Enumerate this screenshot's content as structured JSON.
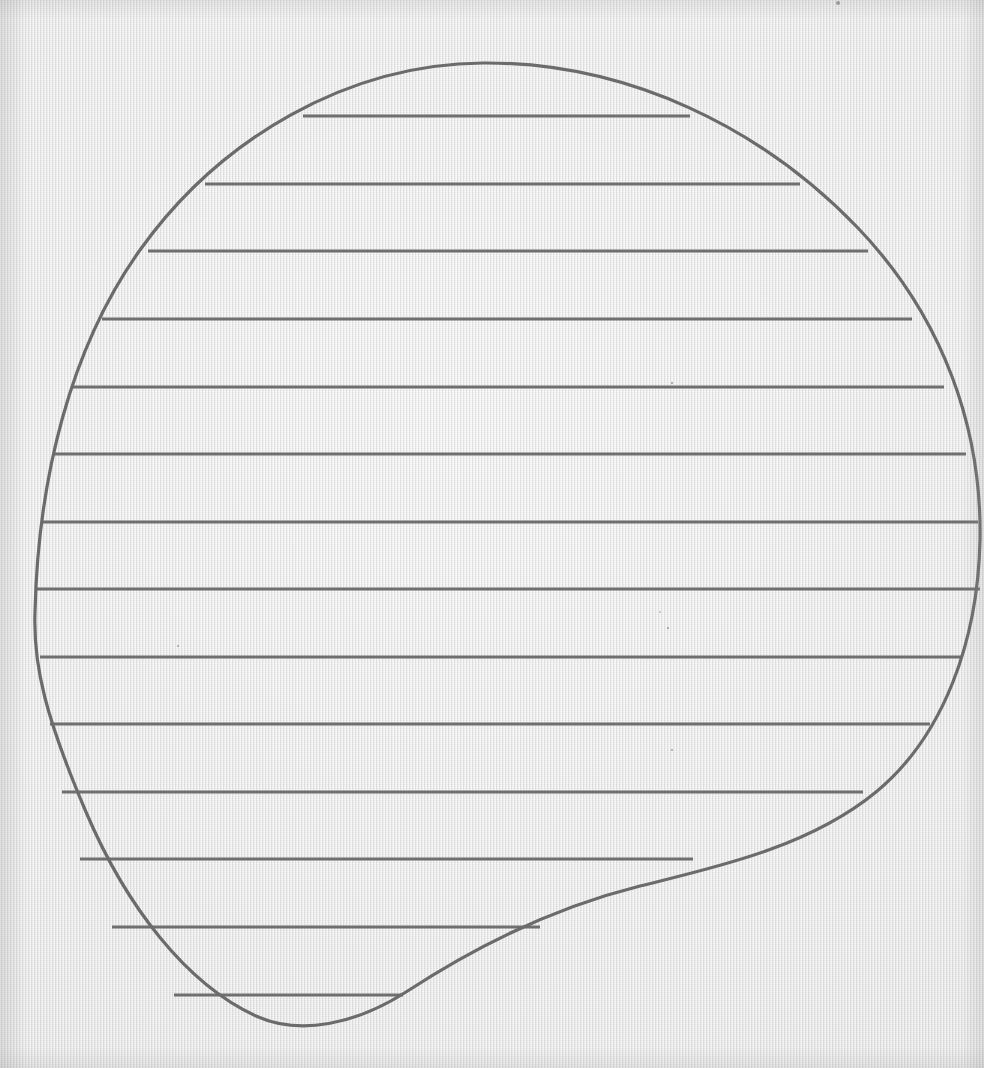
{
  "figure": {
    "kind": "geometry-diagram",
    "medium": "pencil-on-textured-paper",
    "canvas": {
      "width": 984,
      "height": 1068
    },
    "colors": {
      "paper": "#e4e4e4",
      "paper_shadow": "#c9c9c9",
      "ink": "#6f6f6f",
      "ink_outline": "#6b6b6b",
      "speck": "#5a5a5a"
    },
    "stroke": {
      "outline_width": 3.2,
      "chord_width": 3.0
    }
  },
  "chart_data": {
    "type": "line",
    "subtitle": "Horizontal slicing of a planar region (dy-strips)",
    "xlabel": "",
    "ylabel": "",
    "xlim": [
      0,
      984
    ],
    "ylim": [
      1068,
      0
    ],
    "grid": false,
    "legend": null,
    "annotations": [],
    "series": [
      {
        "name": "region-outline",
        "closed": true,
        "description": "Closed blob: near-circular on top and left, with a concave sweep on the lower right",
        "extrema": {
          "top_apex": [
            483,
            63
          ],
          "bottom_apex": [
            283,
            1025
          ],
          "leftmost": [
            35,
            617
          ],
          "rightmost": [
            980,
            540
          ]
        },
        "path": "M 483 63 C 628 62 762 128 858 228 C 944 318 982 430 980 540 C 978 640 944 736 876 792 C 808 848 712 868 640 886 C 552 908 470 950 406 992 C 356 1024 300 1036 256 1016 C 186 984 126 906 86 812 C 46 718 33 666 35 612 C 38 480 70 348 140 250 C 220 138 348 64 483 63 Z"
      },
      {
        "name": "horizontal-chords",
        "description": "Fourteen evenly spaced horizontal chords spanning the interior of the region",
        "count": 14,
        "spacing_px": 67.6,
        "chords": [
          {
            "index": 1,
            "y": 116,
            "x_start": 303,
            "x_end": 690,
            "length": 387
          },
          {
            "index": 2,
            "y": 184,
            "x_start": 205,
            "x_end": 800,
            "length": 595
          },
          {
            "index": 3,
            "y": 251,
            "x_start": 148,
            "x_end": 868,
            "length": 720
          },
          {
            "index": 4,
            "y": 319,
            "x_start": 102,
            "x_end": 912,
            "length": 810
          },
          {
            "index": 5,
            "y": 387,
            "x_start": 73,
            "x_end": 944,
            "length": 871
          },
          {
            "index": 6,
            "y": 454,
            "x_start": 53,
            "x_end": 966,
            "length": 913
          },
          {
            "index": 7,
            "y": 522,
            "x_start": 42,
            "x_end": 978,
            "length": 936
          },
          {
            "index": 8,
            "y": 589,
            "x_start": 36,
            "x_end": 980,
            "length": 944
          },
          {
            "index": 9,
            "y": 657,
            "x_start": 40,
            "x_end": 962,
            "length": 922
          },
          {
            "index": 10,
            "y": 724,
            "x_start": 50,
            "x_end": 930,
            "length": 880
          },
          {
            "index": 11,
            "y": 792,
            "x_start": 62,
            "x_end": 863,
            "length": 801
          },
          {
            "index": 12,
            "y": 859,
            "x_start": 80,
            "x_end": 693,
            "length": 613
          },
          {
            "index": 13,
            "y": 927,
            "x_start": 112,
            "x_end": 540,
            "length": 428
          },
          {
            "index": 14,
            "y": 995,
            "x_start": 174,
            "x_end": 403,
            "length": 229
          }
        ]
      }
    ],
    "marks": [
      {
        "name": "paper-speck",
        "x": 838,
        "y": 3,
        "r": 2.0
      },
      {
        "name": "paper-speck",
        "x": 672,
        "y": 383,
        "r": 1.1
      },
      {
        "name": "paper-speck",
        "x": 668,
        "y": 628,
        "r": 1.0
      },
      {
        "name": "paper-speck",
        "x": 178,
        "y": 646,
        "r": 0.9
      },
      {
        "name": "paper-speck",
        "x": 672,
        "y": 750,
        "r": 0.9
      },
      {
        "name": "paper-speck",
        "x": 660,
        "y": 612,
        "r": 0.8
      }
    ]
  }
}
